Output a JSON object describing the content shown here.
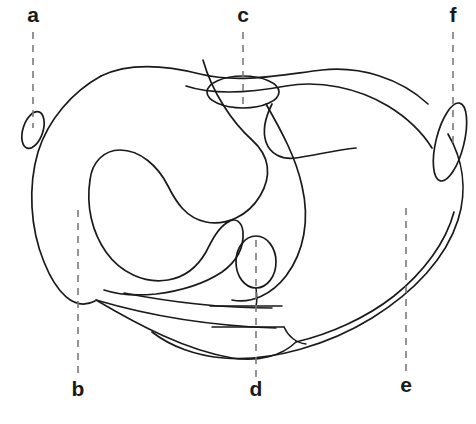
{
  "figure": {
    "type": "labeled-line-diagram",
    "background_color": "#ffffff",
    "line_color": "#1a1a1a",
    "leader_color": "#7a7a7a",
    "label_color": "#1a1a1a",
    "label_style": "bold lowercase letters"
  },
  "labels": [
    {
      "id": "a",
      "text": "a",
      "position": "top-left",
      "label_x": 33,
      "label_y": 22,
      "leader_x": 33,
      "leader_from_y": 32,
      "leader_to_y": 128,
      "points_to": "small tilted oval on left outer margin"
    },
    {
      "id": "c",
      "text": "c",
      "position": "top-center",
      "label_x": 243,
      "label_y": 22,
      "leader_x": 243,
      "leader_from_y": 32,
      "leader_to_y": 104,
      "points_to": "horizontal oval at superior midline"
    },
    {
      "id": "f",
      "text": "f",
      "position": "top-right",
      "label_x": 453,
      "label_y": 22,
      "leader_x": 453,
      "leader_from_y": 32,
      "leader_to_y": 146,
      "points_to": "elongated tilted oval on right outer margin"
    },
    {
      "id": "b",
      "text": "b",
      "position": "bottom-left",
      "label_x": 78,
      "label_y": 396,
      "leader_x": 78,
      "leader_from_y": 210,
      "leader_to_y": 378,
      "points_to": "inferior-left body wall region"
    },
    {
      "id": "d",
      "text": "d",
      "position": "bottom-center",
      "label_x": 256,
      "label_y": 396,
      "leader_x": 256,
      "leader_from_y": 240,
      "leader_to_y": 378,
      "points_to": "vertical oval at inferior midline"
    },
    {
      "id": "e",
      "text": "e",
      "position": "bottom-right",
      "label_x": 406,
      "label_y": 392,
      "leader_x": 406,
      "leader_from_y": 208,
      "leader_to_y": 372,
      "points_to": "inferior-right body wall region"
    }
  ],
  "structures": [
    {
      "name": "outer-body-contour",
      "kind": "closed-contour"
    },
    {
      "name": "inner-c-shaped-swirl",
      "kind": "open-curve"
    },
    {
      "name": "superior-oval-c",
      "kind": "oval"
    },
    {
      "name": "inferior-oval-d",
      "kind": "oval"
    },
    {
      "name": "left-margin-oval-a",
      "kind": "tilted-oval"
    },
    {
      "name": "right-margin-oval-f",
      "kind": "tilted-oval"
    },
    {
      "name": "upper-right-band",
      "kind": "open-curve"
    },
    {
      "name": "lower-fan-lines",
      "kind": "line-group",
      "count": 3
    },
    {
      "name": "midline-tick-upper",
      "kind": "short-line"
    },
    {
      "name": "midline-tick-lower",
      "kind": "short-line"
    }
  ]
}
